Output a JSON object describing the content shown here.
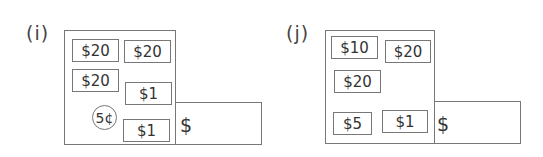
{
  "problems": [
    {
      "id": "i",
      "label": "(i)",
      "bills": [
        {
          "text": "$20",
          "x": 72,
          "y": 39,
          "w": 47,
          "h": 23
        },
        {
          "text": "$20",
          "x": 124,
          "y": 40,
          "w": 47,
          "h": 23
        },
        {
          "text": "$20",
          "x": 72,
          "y": 69,
          "w": 47,
          "h": 23
        },
        {
          "text": "$1",
          "x": 125,
          "y": 82,
          "w": 47,
          "h": 23
        },
        {
          "text": "$1",
          "x": 123,
          "y": 119,
          "w": 47,
          "h": 23
        }
      ],
      "coins": [
        {
          "text": "5¢",
          "cx": 104,
          "cy": 117,
          "r": 12
        }
      ],
      "answer_prefix": "$",
      "answer_value": ""
    },
    {
      "id": "j",
      "label": "(j)",
      "bills": [
        {
          "text": "$10",
          "x": 331,
          "y": 36,
          "w": 47,
          "h": 23
        },
        {
          "text": "$20",
          "x": 385,
          "y": 40,
          "w": 46,
          "h": 23
        },
        {
          "text": "$20",
          "x": 334,
          "y": 70,
          "w": 47,
          "h": 23
        },
        {
          "text": "$5",
          "x": 333,
          "y": 112,
          "w": 39,
          "h": 23
        },
        {
          "text": "$1",
          "x": 382,
          "y": 110,
          "w": 46,
          "h": 23
        }
      ],
      "coins": [],
      "answer_prefix": "$",
      "answer_value": ""
    }
  ]
}
